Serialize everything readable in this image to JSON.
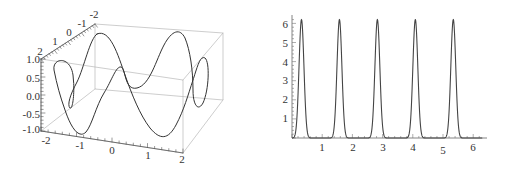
{
  "chart_data": [
    {
      "type": "line",
      "subtype": "3d-parametric-curve",
      "title": "",
      "axes": {
        "x": {
          "range": [
            -2,
            2
          ],
          "ticks": [
            "-2",
            "-1",
            "0",
            "1",
            "2"
          ]
        },
        "y": {
          "range": [
            -2,
            2
          ],
          "ticks": [
            "2",
            "1",
            "0",
            "-1",
            "-2"
          ]
        },
        "z": {
          "range": [
            -1.0,
            1.0
          ],
          "ticks": [
            "1.0",
            "0.5",
            "0.0",
            "-0.5",
            "-1.0"
          ]
        }
      },
      "box": true,
      "description": "Closed 3D curve with two large lobes reaching z=±1 and small loops near x=±2"
    },
    {
      "type": "line",
      "title": "",
      "xlabel": "",
      "ylabel": "",
      "xlim": [
        0,
        6.3
      ],
      "ylim": [
        0,
        6.3
      ],
      "x_ticks": [
        "1",
        "2",
        "3",
        "4",
        "5",
        "6"
      ],
      "y_ticks": [
        "1",
        "2",
        "3",
        "4",
        "5",
        "6"
      ],
      "grid": false,
      "series": [
        {
          "name": "periodic peaks",
          "peak_count": 10,
          "peak_value": 6.2,
          "peak_x": [
            0.31,
            0.94,
            1.57,
            2.2,
            2.83,
            3.46,
            4.08,
            4.71,
            5.34,
            5.97
          ],
          "min_value": 0
        }
      ]
    }
  ],
  "left_plot": {
    "z_labels": [
      "1.0",
      "0.5",
      "0.0",
      "-0.5",
      "-1.0"
    ],
    "x_labels": [
      "-2",
      "-1",
      "0",
      "1",
      "2"
    ],
    "y_labels": [
      "2",
      "1",
      "0",
      "-1",
      "-2"
    ]
  },
  "right_plot": {
    "y_labels": [
      "1",
      "2",
      "3",
      "4",
      "5",
      "6"
    ],
    "x_labels": [
      "1",
      "2",
      "3",
      "4",
      "5",
      "6"
    ]
  }
}
